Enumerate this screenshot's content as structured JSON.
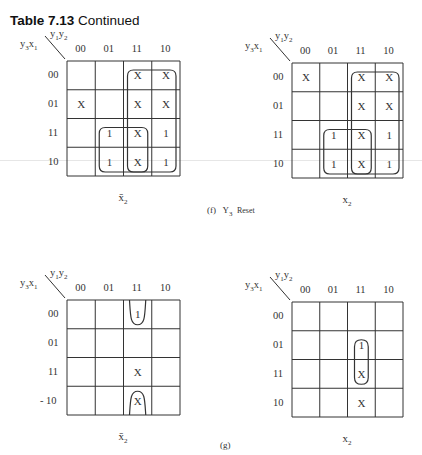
{
  "header": {
    "table_label": "Table 7.13",
    "title": "Continued"
  },
  "axis": {
    "column_var": "y1y2",
    "row_var": "y3x1",
    "column_labels": [
      "00",
      "01",
      "11",
      "10"
    ],
    "row_labels": [
      "00",
      "01",
      "11",
      "10"
    ]
  },
  "captions": {
    "f": "(f)  Y3 Reset",
    "f_parts": {
      "prefix": "(f)",
      "var": "Y",
      "sub": "3",
      "suffix": "Reset"
    },
    "g": "(g)"
  },
  "maps": [
    {
      "id": "f-x2bar",
      "label": "x̄2",
      "label_var": "x̄",
      "label_sub": "2",
      "row_labels": [
        "00",
        "01",
        "11",
        "10"
      ],
      "cells": [
        [
          "",
          "",
          "X",
          "X"
        ],
        [
          "X",
          "",
          "X",
          "X"
        ],
        [
          "",
          "1",
          "X",
          "1"
        ],
        [
          "",
          "1",
          "X",
          "1"
        ]
      ],
      "loops": [
        {
          "cols": [
            2,
            3
          ],
          "rows": [
            0,
            3
          ]
        },
        {
          "cols": [
            1,
            2
          ],
          "rows": [
            2,
            3
          ]
        }
      ]
    },
    {
      "id": "f-x2",
      "label": "x2",
      "label_var": "x",
      "label_sub": "2",
      "row_labels": [
        "00",
        "01",
        "11",
        "10"
      ],
      "cells": [
        [
          "X",
          "",
          "X",
          "X"
        ],
        [
          "",
          "",
          "X",
          "X"
        ],
        [
          "",
          "1",
          "X",
          "1"
        ],
        [
          "",
          "1",
          "X",
          "1"
        ]
      ],
      "loops": [
        {
          "cols": [
            2,
            3
          ],
          "rows": [
            0,
            3
          ]
        },
        {
          "cols": [
            1,
            2
          ],
          "rows": [
            2,
            3
          ]
        }
      ]
    },
    {
      "id": "g-x2bar",
      "label": "x̄2",
      "label_var": "x̄",
      "label_sub": "2",
      "row_labels": [
        "00",
        "01",
        "11",
        "- 10"
      ],
      "cells": [
        [
          "",
          "",
          "1",
          ""
        ],
        [
          "",
          "",
          "",
          ""
        ],
        [
          "",
          "",
          "X",
          ""
        ],
        [
          "",
          "",
          "X",
          ""
        ]
      ],
      "loops": [
        {
          "cols": [
            2,
            2
          ],
          "rows": [
            0,
            0
          ],
          "open": "top"
        },
        {
          "cols": [
            2,
            2
          ],
          "rows": [
            3,
            3
          ],
          "open": "bottom"
        }
      ]
    },
    {
      "id": "g-x2",
      "label": "x2",
      "label_var": "x",
      "label_sub": "2",
      "row_labels": [
        "00",
        "01",
        "11",
        "10"
      ],
      "cells": [
        [
          "",
          "",
          "",
          ""
        ],
        [
          "",
          "",
          "1",
          ""
        ],
        [
          "",
          "",
          "X",
          ""
        ],
        [
          "",
          "",
          "X",
          ""
        ]
      ],
      "loops": [
        {
          "cols": [
            2,
            2
          ],
          "rows": [
            1,
            2
          ]
        }
      ]
    }
  ]
}
